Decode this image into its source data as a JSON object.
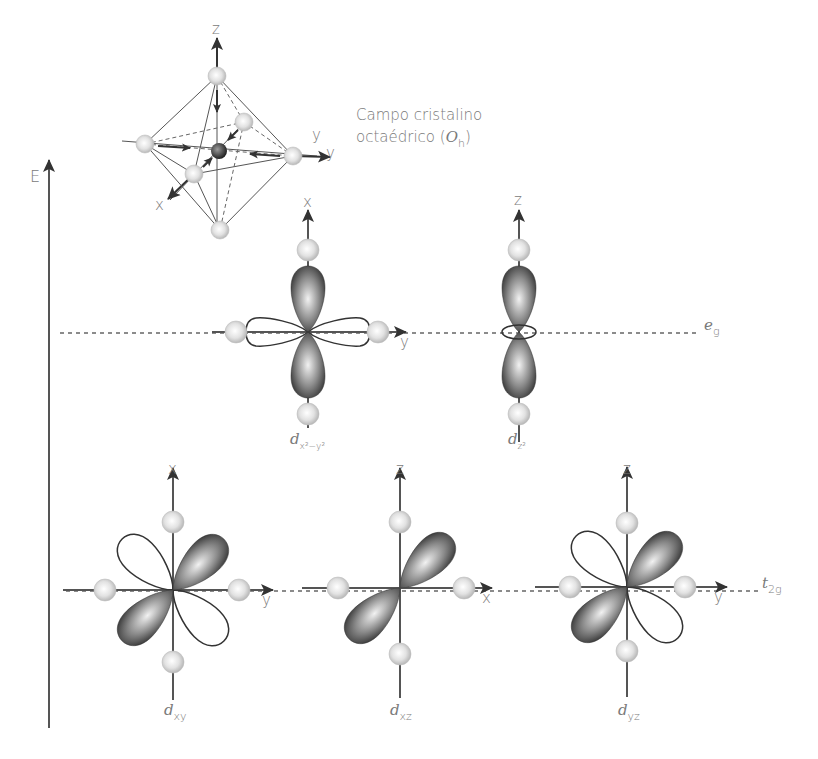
{
  "crystal_field": {
    "title_line1": "Campo cristalino",
    "title_line2_prefix": "octaédrico (",
    "title_symbol": "O",
    "title_symbol_sub": "h",
    "title_line2_suffix": ")",
    "axes": {
      "z": "z",
      "y_inner": "y",
      "y_outer": "y",
      "x": "x"
    }
  },
  "energy_axis": {
    "label": "E"
  },
  "levels": {
    "eg": {
      "label": "e",
      "sub": "g"
    },
    "t2g": {
      "label": "t",
      "sub": "2g"
    }
  },
  "orbitals": [
    {
      "id": "dx2y2",
      "label": "d",
      "sub": "x²−y²",
      "axis_up": "x",
      "axis_right": "y",
      "level": "eg"
    },
    {
      "id": "dz2",
      "label": "d",
      "sub": "z²",
      "axis_up": "z",
      "axis_right": "",
      "level": "eg"
    },
    {
      "id": "dxy",
      "label": "d",
      "sub": "xy",
      "axis_up": "x",
      "axis_right": "y",
      "level": "t2g"
    },
    {
      "id": "dxz",
      "label": "d",
      "sub": "xz",
      "axis_up": "z",
      "axis_right": "x",
      "level": "t2g"
    },
    {
      "id": "dyz",
      "label": "d",
      "sub": "yz",
      "axis_up": "z",
      "axis_right": "y",
      "level": "t2g"
    }
  ],
  "colors": {
    "line": "#555555",
    "ligand": "#d8d8d8",
    "lobe_dark": "#3a3a3a",
    "lobe_light": "#e6e6e6",
    "text": "#7a7a7a"
  }
}
